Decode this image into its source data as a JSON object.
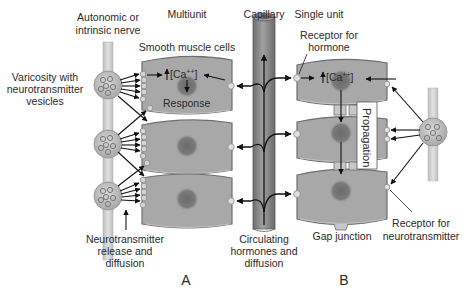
{
  "diagram": {
    "panels": [
      {
        "id": "A",
        "label": "A",
        "title": "Multiunit"
      },
      {
        "id": "B",
        "label": "B",
        "title": "Single unit"
      }
    ],
    "labels": {
      "nerve_line1": "Autonomic or",
      "nerve_line2": "intrinsic nerve",
      "multiunit": "Multiunit",
      "capillary": "Capillary",
      "single_unit": "Single unit",
      "smooth_muscle": "Smooth muscle cells",
      "varicosity_line1": "Varicosity with",
      "varicosity_line2": "neurotransmitter",
      "varicosity_line3": "vesicles",
      "receptor_hormone_line1": "Receptor for",
      "receptor_hormone_line2": "hormone",
      "calcium": "[Ca++]",
      "calcium_base": "[Ca",
      "calcium_sup": "++",
      "calcium_close": "]",
      "response": "Response",
      "propagation": "Propagation",
      "nt_release_line1": "Neurotransmitter",
      "nt_release_line2": "release and",
      "nt_release_line3": "diffusion",
      "circulating_line1": "Circulating",
      "circulating_line2": "hormones and",
      "circulating_line3": "diffusion",
      "gap_junction": "Gap junction",
      "receptor_nt_line1": "Receptor for",
      "receptor_nt_line2": "neurotransmitter",
      "panel_a": "A",
      "panel_b": "B"
    },
    "colors": {
      "cell_fill": "#a9a9a9",
      "cell_stroke": "#6e6e6e",
      "nucleus": "#777777",
      "nerve": "#cfcfcf",
      "capillary": "#8a8a8a",
      "arrow": "#111111",
      "text": "#2a2a2a"
    }
  }
}
